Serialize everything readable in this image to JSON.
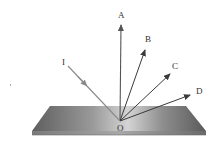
{
  "diagram": {
    "type": "light-reflection",
    "labels": {
      "A": "A",
      "B": "B",
      "C": "C",
      "D": "D",
      "I": "I",
      "O": "O"
    },
    "colors": {
      "incident_ray": "#8a8a8a",
      "reflected_rays": "#3a3a3a",
      "normal": "#555555",
      "surface_light": "#c8c8c8",
      "surface_dark": "#5a5a5a",
      "label": "#333333"
    },
    "points": {
      "O": [
        120,
        121
      ],
      "A": [
        121,
        23
      ],
      "B": [
        146,
        48
      ],
      "C": [
        172,
        72
      ],
      "D": [
        192,
        94
      ],
      "I": [
        68,
        66
      ]
    },
    "rays": [
      {
        "from": "I",
        "to": "O",
        "kind": "incident"
      },
      {
        "from": "O",
        "to": "A",
        "kind": "normal"
      },
      {
        "from": "O",
        "to": "B",
        "kind": "reflected"
      },
      {
        "from": "O",
        "to": "C",
        "kind": "reflected"
      },
      {
        "from": "O",
        "to": "D",
        "kind": "reflected"
      }
    ]
  }
}
